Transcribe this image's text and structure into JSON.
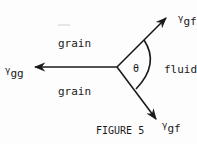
{
  "diagram": {
    "labels": {
      "grain_top": "grain",
      "grain_bottom": "grain",
      "fluid": "fluid",
      "theta": "θ",
      "caption": "FIGURE 5"
    },
    "vectors": [
      {
        "symbol": "γ",
        "subscript": "gg",
        "direction": "left"
      },
      {
        "symbol": "γ",
        "subscript": "gf",
        "direction": "up-right"
      },
      {
        "symbol": "γ",
        "subscript": "gf",
        "direction": "down-right"
      }
    ],
    "colors": {
      "ink": "#1a1a1a",
      "background": "#fdfdfd"
    }
  }
}
